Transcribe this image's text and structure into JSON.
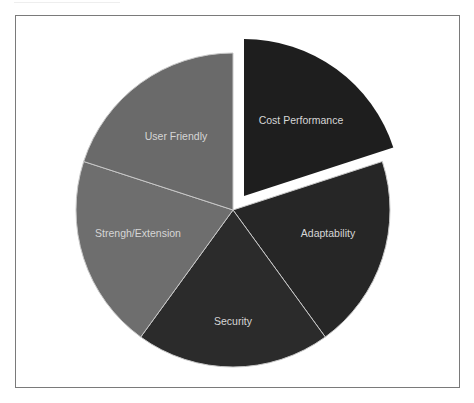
{
  "chart_data": {
    "type": "pie",
    "title": "",
    "legend": "none",
    "labels_position": "inside",
    "start_angle_deg": 0,
    "direction": "clockwise",
    "slices": [
      {
        "label": "Cost Performance",
        "value": 20,
        "color": "#1e1e1e",
        "exploded": true,
        "label_pos": [
          301,
          121
        ]
      },
      {
        "label": "Adaptability",
        "value": 20,
        "color": "#262626",
        "exploded": false,
        "label_pos": [
          328,
          234
        ]
      },
      {
        "label": "Security",
        "value": 20,
        "color": "#2b2b2b",
        "exploded": false,
        "label_pos": [
          233,
          322
        ]
      },
      {
        "label": "Strengh/Extension",
        "value": 20,
        "color": "#6e6e6e",
        "exploded": false,
        "label_pos": [
          138,
          234
        ]
      },
      {
        "label": "User Friendly",
        "value": 20,
        "color": "#6a6a6a",
        "exploded": false,
        "label_pos": [
          176,
          137
        ]
      }
    ],
    "categories": [
      "Cost Performance",
      "Adaptability",
      "Security",
      "Strengh/Extension",
      "User Friendly"
    ],
    "values": [
      20,
      20,
      20,
      20,
      20
    ]
  },
  "layout": {
    "center": [
      233,
      210
    ],
    "radius": 157,
    "explode_offset": [
      11,
      -14
    ],
    "separator_color": "#c8c8c8"
  }
}
